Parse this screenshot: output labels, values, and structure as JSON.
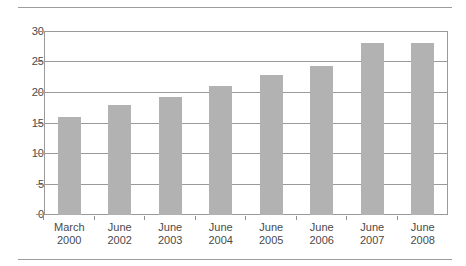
{
  "chart_data": {
    "type": "bar",
    "title": "",
    "subtitle": "",
    "xlabel": "",
    "ylabel": "",
    "categories": [
      "March\n2000",
      "June\n2002",
      "June\n2003",
      "June\n2004",
      "June\n2005",
      "June\n2006",
      "June\n2007",
      "June\n2008"
    ],
    "category_lines": [
      {
        "month": "March",
        "year": "2000"
      },
      {
        "month": "June",
        "year": "2002"
      },
      {
        "month": "June",
        "year": "2003"
      },
      {
        "month": "June",
        "year": "2004"
      },
      {
        "month": "June",
        "year": "2005"
      },
      {
        "month": "June",
        "year": "2006"
      },
      {
        "month": "June",
        "year": "2007"
      },
      {
        "month": "June",
        "year": "2008"
      }
    ],
    "values": [
      16,
      18,
      19.2,
      21,
      22.8,
      24.3,
      28,
      28
    ],
    "ylim": [
      0,
      30
    ],
    "yticks": [
      0,
      5,
      10,
      15,
      20,
      25,
      30
    ],
    "ytick_labels": [
      "0",
      "5",
      "10",
      "15",
      "20",
      "25",
      "30"
    ],
    "grid": true,
    "grid_axis": "y",
    "legend": "none",
    "bar_color": "#b2b2b2",
    "axis_color": "#9a9a9a",
    "text_color": "#4a4a4a"
  }
}
